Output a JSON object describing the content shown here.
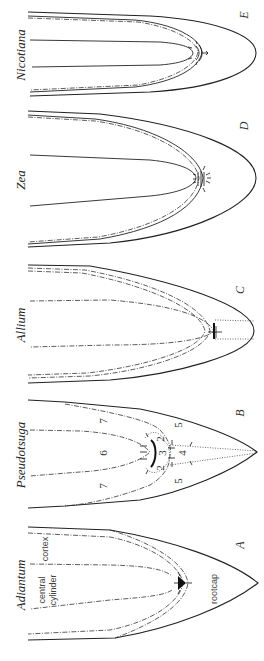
{
  "figure": {
    "panels": [
      {
        "letter": "A",
        "genus": "Adiantum",
        "labels": {
          "cortex": "cortex",
          "central_cylinder_1": "central",
          "central_cylinder_2": "cylinder",
          "rootcap": "rootcap"
        }
      },
      {
        "letter": "B",
        "genus": "Pseudotsuga",
        "zone_numbers": [
          "7",
          "6",
          "7",
          "5",
          "2",
          "3",
          "2",
          "4",
          "5"
        ]
      },
      {
        "letter": "C",
        "genus": "Allium"
      },
      {
        "letter": "D",
        "genus": "Zea"
      },
      {
        "letter": "E",
        "genus": "Nicotiana"
      }
    ]
  }
}
